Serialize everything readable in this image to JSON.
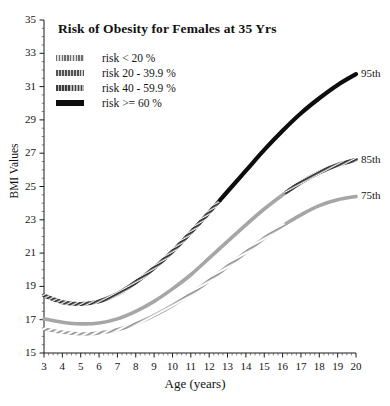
{
  "chart_data": {
    "type": "line",
    "title": "Risk of Obesity for Females at 35 Yrs",
    "xlabel": "Age (years)",
    "ylabel": "BMI Values",
    "xlim": [
      3,
      20
    ],
    "ylim": [
      15,
      35
    ],
    "xticks": [
      3,
      4,
      5,
      6,
      7,
      8,
      9,
      10,
      11,
      12,
      13,
      14,
      15,
      16,
      17,
      18,
      19,
      20
    ],
    "yticks": [
      15,
      17,
      19,
      21,
      23,
      25,
      27,
      29,
      31,
      33,
      35
    ],
    "grid": false,
    "minor_ticks": true,
    "legend_position": "upper-left",
    "x": [
      3,
      4,
      5,
      6,
      7,
      8,
      9,
      10,
      11,
      12,
      13,
      14,
      15,
      16,
      17,
      18,
      19,
      20
    ],
    "series": [
      {
        "name": "95th",
        "label": "95th",
        "risk_band": "risk >= 60 %",
        "color": "#0d0d0d",
        "values": [
          18.45,
          18.05,
          17.95,
          18.1,
          18.55,
          19.25,
          20.1,
          21.1,
          22.25,
          23.45,
          24.7,
          25.95,
          27.2,
          28.35,
          29.4,
          30.3,
          31.1,
          31.75
        ],
        "segments": [
          {
            "from_age": 3,
            "to_age": 12.6,
            "risk_band": "risk 40 - 59.9 %",
            "style": "hatched-dark"
          },
          {
            "from_age": 12.6,
            "to_age": 20,
            "risk_band": "risk >= 60 %",
            "style": "solid-black"
          }
        ]
      },
      {
        "name": "85th",
        "label": "85th",
        "risk_band": "risk 20 - 39.9 %",
        "color": "#9a9a9a",
        "values": [
          17.05,
          16.85,
          16.75,
          16.8,
          17.05,
          17.5,
          18.1,
          18.85,
          19.7,
          20.7,
          21.7,
          22.7,
          23.65,
          24.5,
          25.25,
          25.85,
          26.3,
          26.6
        ],
        "segments": [
          {
            "from_age": 3,
            "to_age": 16.2,
            "risk_band": "risk 20 - 39.9 %",
            "style": "solid-grey"
          },
          {
            "from_age": 16.2,
            "to_age": 20,
            "risk_band": "risk 40 - 59.9 %",
            "style": "hatched-dark"
          }
        ]
      },
      {
        "name": "75th",
        "label": "75th",
        "risk_band": "risk < 20 %",
        "color": "#b0b0b0",
        "values": [
          16.45,
          16.25,
          16.15,
          16.2,
          16.4,
          16.75,
          17.25,
          17.85,
          18.55,
          19.35,
          20.2,
          21.05,
          21.9,
          22.65,
          23.3,
          23.85,
          24.2,
          24.4
        ],
        "segments": [
          {
            "from_age": 3,
            "to_age": 16.2,
            "risk_band": "risk < 20 %",
            "style": "hatched-light"
          },
          {
            "from_age": 16.2,
            "to_age": 20,
            "risk_band": "risk 20 - 39.9 %",
            "style": "solid-grey"
          }
        ]
      }
    ],
    "legend": [
      {
        "label": "risk < 20 %",
        "swatch": "hatched-light"
      },
      {
        "label": "risk 20 - 39.9 %",
        "swatch": "hatched-mid"
      },
      {
        "label": "risk 40 - 59.9 %",
        "swatch": "hatched-dark"
      },
      {
        "label": "risk >= 60 %",
        "swatch": "solid-black"
      }
    ],
    "curve_labels": [
      {
        "text": "95th",
        "age": 20,
        "bmi": 31.75
      },
      {
        "text": "85th",
        "age": 20,
        "bmi": 26.6
      },
      {
        "text": "75th",
        "age": 20,
        "bmi": 24.4
      }
    ]
  }
}
